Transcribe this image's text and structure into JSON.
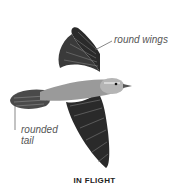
{
  "illustration": {
    "subject": "bird in flight, dorsal view",
    "colors": {
      "wing": "#2a2a2a",
      "body": "#9a9a9a",
      "head": "#b5b5b5",
      "line": "#555555"
    }
  },
  "annotations": {
    "wings": "round wings",
    "tail_line1": "rounded",
    "tail_line2": "tail"
  },
  "caption": "IN FLIGHT"
}
